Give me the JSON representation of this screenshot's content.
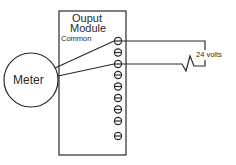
{
  "diagram": {
    "module": {
      "title_line1": "Ouput",
      "title_line2": "Module",
      "common_label": "Common",
      "terminal_count": 9
    },
    "meter": {
      "label": "Meter"
    },
    "supply": {
      "label": "24  volts"
    },
    "colors": {
      "line": "#2a2a2a",
      "background": "#ffffff"
    }
  }
}
